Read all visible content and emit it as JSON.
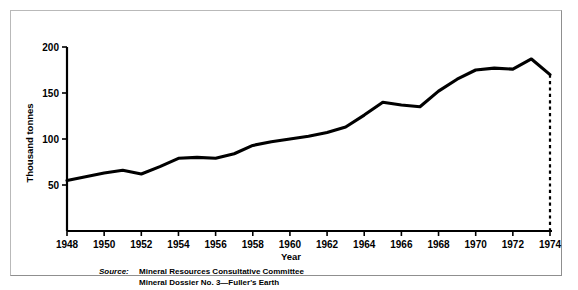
{
  "figure": {
    "source_label": "Source:",
    "source_line_1": "Mineral Resources Consultative Committee",
    "source_line_2": "Mineral Dossier No. 3—Fuller's Earth",
    "frame_color": "#b9b9b9",
    "line_color": "#000000",
    "background_color": "#ffffff"
  },
  "chart_data": {
    "type": "line",
    "title": "",
    "xlabel": "Year",
    "ylabel": "Thousand tonnes",
    "xlim": [
      1948,
      1974
    ],
    "ylim": [
      0,
      200
    ],
    "grid": false,
    "legend": false,
    "xticks": [
      1948,
      1950,
      1952,
      1954,
      1956,
      1958,
      1960,
      1962,
      1964,
      1966,
      1968,
      1970,
      1972,
      1974
    ],
    "xtick_labels": [
      "1948",
      "1950",
      "1952",
      "1954",
      "1956",
      "1958",
      "1960",
      "1962",
      "1964",
      "1966",
      "1968",
      "1970",
      "1972",
      "1974"
    ],
    "yticks": [
      50,
      100,
      150,
      200
    ],
    "ytick_labels": [
      "50",
      "100",
      "150",
      "200"
    ],
    "x": [
      1948,
      1949,
      1950,
      1951,
      1952,
      1953,
      1954,
      1955,
      1956,
      1957,
      1958,
      1959,
      1960,
      1961,
      1962,
      1963,
      1964,
      1965,
      1966,
      1967,
      1968,
      1969,
      1970,
      1971,
      1972,
      1973,
      1974
    ],
    "values": [
      55,
      59,
      63,
      66,
      62,
      70,
      79,
      80,
      79,
      84,
      93,
      97,
      100,
      103,
      107,
      113,
      126,
      140,
      137,
      135,
      152,
      165,
      175,
      177,
      176,
      187,
      170
    ],
    "series": [
      {
        "name": "Fuller's Earth production",
        "values": [
          55,
          59,
          63,
          66,
          62,
          70,
          79,
          80,
          79,
          84,
          93,
          97,
          100,
          103,
          107,
          113,
          126,
          140,
          137,
          135,
          152,
          165,
          175,
          177,
          176,
          187,
          170
        ]
      }
    ],
    "annotations": [
      {
        "kind": "dashed-drop-line",
        "x": 1974,
        "y_from": 170,
        "y_to": 0,
        "note": "dashed vertical line from 1974 value down to axis"
      }
    ]
  }
}
